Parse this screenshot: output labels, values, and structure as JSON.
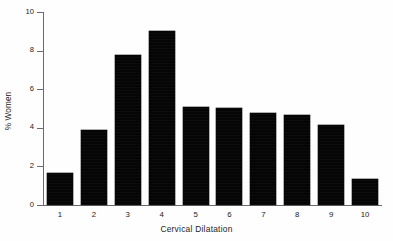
{
  "chart_data": {
    "type": "bar",
    "title": "",
    "xlabel": "Cervical Dilatation",
    "ylabel": "% Women",
    "categories": [
      "1",
      "2",
      "3",
      "4",
      "5",
      "6",
      "7",
      "8",
      "9",
      "10"
    ],
    "values": [
      1.65,
      3.9,
      7.75,
      9.0,
      5.1,
      5.05,
      4.75,
      4.65,
      4.15,
      1.35
    ],
    "ylim": [
      0,
      10
    ],
    "yticks": [
      0,
      2,
      4,
      6,
      8,
      10
    ],
    "ytick_labels": [
      "0",
      "2",
      "4",
      "6",
      "8",
      "10"
    ],
    "xlim": [
      0.5,
      10.5
    ],
    "grid": false,
    "legend": false,
    "bar_color": "#050505",
    "axis_color": "#6b6b6b",
    "background": "#ffffff"
  },
  "axes": {
    "x_title": "Cervical Dilatation",
    "y_title": "% Women"
  }
}
